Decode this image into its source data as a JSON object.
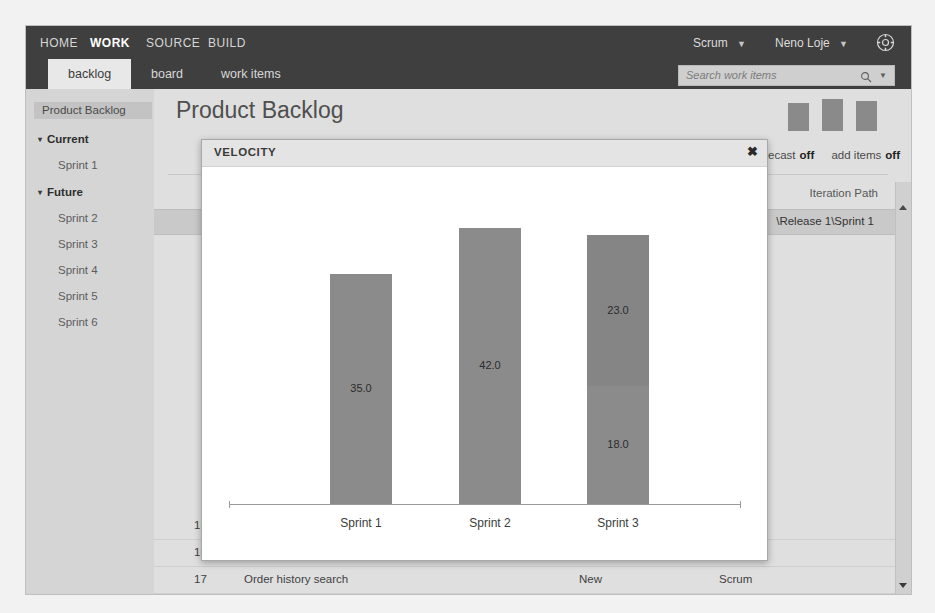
{
  "topnav": {
    "items": [
      {
        "label": "HOME",
        "active": false
      },
      {
        "label": "WORK",
        "active": true
      },
      {
        "label": "SOURCE",
        "active": false
      },
      {
        "label": "BUILD",
        "active": false
      }
    ],
    "process": "Scrum",
    "user": "Neno Loje",
    "gear_icon": "gear-icon",
    "caret": "▼"
  },
  "search": {
    "placeholder": "Search work items",
    "value": "",
    "icon": "search-icon",
    "caret": "▼"
  },
  "tabs": [
    {
      "label": "backlog",
      "active": true
    },
    {
      "label": "board",
      "active": false
    },
    {
      "label": "work items",
      "active": false
    }
  ],
  "sidebar": {
    "header": "Product Backlog",
    "groups": [
      {
        "label": "Current",
        "triangle": "▾",
        "items": [
          "Sprint 1"
        ]
      },
      {
        "label": "Future",
        "triangle": "▾",
        "items": [
          "Sprint 2",
          "Sprint 3",
          "Sprint 4",
          "Sprint 5",
          "Sprint 6"
        ]
      }
    ]
  },
  "main": {
    "page_title": "Product Backlog",
    "toolbar": {
      "forecast_label": "forecast",
      "forecast_state": "off",
      "add_items_label": "add items",
      "add_items_state": "off"
    },
    "grid": {
      "iteration_header": "Iteration Path",
      "selected_iteration": "\\Release 1\\Sprint 1",
      "rows": [
        {
          "id": "15",
          "title": "Track shipments",
          "state": "New",
          "type": "Scrum"
        },
        {
          "id": "16",
          "title": "Preferences remembered for future orders",
          "state": "New",
          "type": "Scrum"
        },
        {
          "id": "17",
          "title": "Order history search",
          "state": "New",
          "type": "Scrum"
        }
      ]
    }
  },
  "dialog": {
    "title": "VELOCITY",
    "close_label": "✖"
  },
  "chart_data": {
    "type": "bar",
    "title": "VELOCITY",
    "categories": [
      "Sprint 1",
      "Sprint 2",
      "Sprint 3"
    ],
    "xlabel": "",
    "ylabel": "",
    "ylim": [
      0,
      45
    ],
    "grid": false,
    "legend": "none",
    "stacked": true,
    "series": [
      {
        "name": "Completed",
        "values": [
          35.0,
          42.0,
          18.0
        ]
      },
      {
        "name": "Planned",
        "values": [
          0,
          0,
          23.0
        ]
      }
    ],
    "bars": [
      {
        "category": "Sprint 1",
        "total": 35.0,
        "segments": [
          {
            "value": 35.0,
            "label": "35.0",
            "color": "#8b8b8b"
          }
        ]
      },
      {
        "category": "Sprint 2",
        "total": 42.0,
        "segments": [
          {
            "value": 42.0,
            "label": "42.0",
            "color": "#8b8b8b"
          }
        ]
      },
      {
        "category": "Sprint 3",
        "total": 41.0,
        "segments": [
          {
            "value": 23.0,
            "label": "23.0",
            "color": "#858585"
          },
          {
            "value": 18.0,
            "label": "18.0",
            "color": "#8b8b8b"
          }
        ]
      }
    ]
  },
  "colors": {
    "nav_background": "#3f3f3f",
    "bar_fill": "#8b8b8b",
    "page_background": "#dcdcdc",
    "dialog_background": "#ffffff"
  }
}
